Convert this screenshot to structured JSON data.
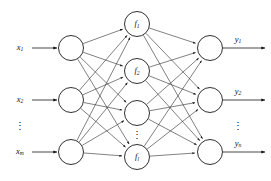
{
  "figure": {
    "background_color": "#ffffff",
    "stroke_color": "#1a1a1a",
    "edge_color": "#2b2b2b",
    "node_fill": "#ffffff"
  },
  "input_layer": {
    "name": "input-layer",
    "node_count": 3,
    "nodes": [
      {
        "label": "",
        "cx": 71,
        "cy": 48,
        "r": 12.5
      },
      {
        "label": "",
        "cx": 71,
        "cy": 100,
        "r": 12.5
      },
      {
        "label": "",
        "cx": 71,
        "cy": 152,
        "r": 12.5
      }
    ],
    "labels": [
      {
        "base": "x",
        "sub": "1",
        "x": 20,
        "y": 48
      },
      {
        "base": "x",
        "sub": "2",
        "x": 20,
        "y": 100
      },
      {
        "base": "x",
        "sub": "m",
        "x": 20,
        "y": 152
      }
    ],
    "ellipsis": {
      "glyph": "⋮",
      "x": 20,
      "y": 127
    },
    "arrows": [
      {
        "x1": 32,
        "y1": 48,
        "x2": 57,
        "y2": 48
      },
      {
        "x1": 32,
        "y1": 100,
        "x2": 57,
        "y2": 100
      },
      {
        "x1": 32,
        "y1": 152,
        "x2": 57,
        "y2": 152
      }
    ]
  },
  "hidden_layer": {
    "name": "hidden-layer",
    "node_count": 4,
    "nodes": [
      {
        "label_base": "f",
        "label_sub": "1",
        "cx": 137,
        "cy": 24,
        "r": 12.5
      },
      {
        "label_base": "f",
        "label_sub": "2",
        "cx": 137,
        "cy": 71,
        "r": 12.5
      },
      {
        "label_base": "",
        "label_sub": "",
        "cx": 137,
        "cy": 113,
        "r": 12.5
      },
      {
        "label_base": "f",
        "label_sub": "l",
        "cx": 137,
        "cy": 157,
        "r": 12.5
      }
    ],
    "ellipsis": {
      "glyph": "⋮",
      "x": 137,
      "y": 136
    }
  },
  "output_layer": {
    "name": "output-layer",
    "node_count": 3,
    "nodes": [
      {
        "label": "",
        "cx": 210,
        "cy": 48,
        "r": 12.5
      },
      {
        "label": "",
        "cx": 210,
        "cy": 100,
        "r": 12.5
      },
      {
        "label": "",
        "cx": 210,
        "cy": 152,
        "r": 12.5
      }
    ],
    "labels": [
      {
        "base": "y",
        "sub": "1",
        "x": 238,
        "y": 40
      },
      {
        "base": "y",
        "sub": "2",
        "x": 238,
        "y": 92
      },
      {
        "base": "y",
        "sub": "n",
        "x": 238,
        "y": 144
      }
    ],
    "ellipsis": {
      "glyph": "⋮",
      "x": 238,
      "y": 127
    },
    "arrows": [
      {
        "x1": 223,
        "y1": 48,
        "x2": 265,
        "y2": 48
      },
      {
        "x1": 223,
        "y1": 100,
        "x2": 265,
        "y2": 100
      },
      {
        "x1": 223,
        "y1": 152,
        "x2": 265,
        "y2": 152
      }
    ]
  },
  "connections": {
    "input_to_hidden": "fully-connected",
    "hidden_to_output": "fully-connected",
    "arrowheads": "right-pointing-filled"
  }
}
